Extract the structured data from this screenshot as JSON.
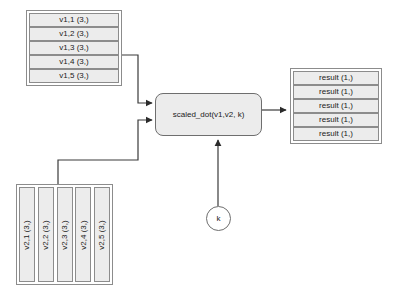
{
  "diagram": {
    "background_color": "#ffffff",
    "node_fill_color": "#ececec",
    "node_border_color": "#8c8c8c",
    "edge_color": "#404040"
  },
  "inputs": {
    "v1_stack": {
      "name": "v1",
      "orientation": "horizontal-rows",
      "cells": [
        {
          "label": "v1,1 (3,)"
        },
        {
          "label": "v1,2 (3,)"
        },
        {
          "label": "v1,3 (3,)"
        },
        {
          "label": "v1,4 (3,)"
        },
        {
          "label": "v1,5 (3,)"
        }
      ]
    },
    "v2_stack": {
      "name": "v2",
      "orientation": "vertical-columns",
      "cells": [
        {
          "label": "v2,1 (3,)"
        },
        {
          "label": "v2,2 (3,)"
        },
        {
          "label": "v2,3 (3,)"
        },
        {
          "label": "v2,4 (3,)"
        },
        {
          "label": "v2,5 (3,)"
        }
      ]
    },
    "k_scalar": {
      "label": "k"
    }
  },
  "operation": {
    "label": "scaled_dot(v1,v2, k)"
  },
  "outputs": {
    "result_stack": {
      "name": "result",
      "orientation": "horizontal-rows",
      "cells": [
        {
          "label": "result (1,)"
        },
        {
          "label": "result (1,)"
        },
        {
          "label": "result (1,)"
        },
        {
          "label": "result (1,)"
        },
        {
          "label": "result (1,)"
        }
      ]
    }
  },
  "edges": [
    {
      "from": "v1_stack",
      "to": "operation"
    },
    {
      "from": "v2_stack",
      "to": "operation"
    },
    {
      "from": "k_scalar",
      "to": "operation"
    },
    {
      "from": "operation",
      "to": "result_stack"
    }
  ]
}
